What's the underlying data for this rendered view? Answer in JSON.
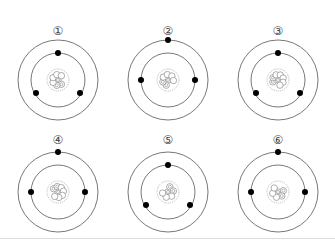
{
  "figure": {
    "atoms": [
      {
        "label": "1",
        "cx": 58,
        "cy": 80,
        "outer_electron_layout": "none",
        "inner_electrons": [
          [
            58,
            53
          ],
          [
            36,
            93
          ],
          [
            80,
            93
          ]
        ],
        "outer_electrons": [],
        "nucleus": {
          "protons": 3,
          "neutrons": 4
        }
      },
      {
        "label": "2",
        "cx": 168,
        "cy": 80,
        "inner_electrons": [
          [
            141,
            80
          ],
          [
            195,
            80
          ]
        ],
        "outer_electrons": [
          [
            168,
            40
          ]
        ],
        "nucleus": {
          "protons": 3,
          "neutrons": 4
        }
      },
      {
        "label": "3",
        "cx": 278,
        "cy": 80,
        "inner_electrons": [
          [
            278,
            53
          ],
          [
            256,
            93
          ],
          [
            300,
            93
          ]
        ],
        "outer_electrons": [],
        "nucleus": {
          "protons": 3,
          "neutrons": 5
        }
      },
      {
        "label": "4",
        "cx": 58,
        "cy": 192,
        "inner_electrons": [
          [
            31,
            192
          ],
          [
            85,
            192
          ]
        ],
        "outer_electrons": [
          [
            58,
            152
          ]
        ],
        "nucleus": {
          "protons": 3,
          "neutrons": 5
        }
      },
      {
        "label": "5",
        "cx": 168,
        "cy": 192,
        "inner_electrons": [
          [
            168,
            165
          ],
          [
            146,
            205
          ],
          [
            190,
            205
          ]
        ],
        "outer_electrons": [],
        "nucleus": {
          "protons": 3,
          "neutrons": 3
        }
      },
      {
        "label": "6",
        "cx": 278,
        "cy": 192,
        "inner_electrons": [
          [
            251,
            192
          ],
          [
            305,
            192
          ]
        ],
        "outer_electrons": [
          [
            278,
            152
          ]
        ],
        "nucleus": {
          "protons": 3,
          "neutrons": 3
        }
      }
    ],
    "colors": {
      "line": "#555555",
      "electron": "#000000",
      "nucleus_border": "#888888",
      "background": "#ffffff"
    }
  },
  "labels": [
    "①",
    "②",
    "③",
    "④",
    "⑤",
    "⑥"
  ]
}
